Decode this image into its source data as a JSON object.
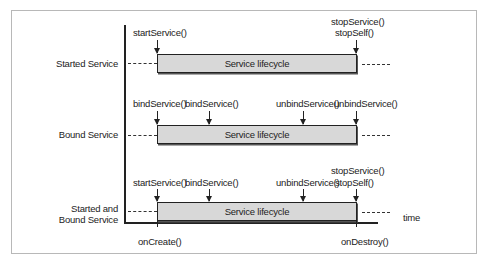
{
  "diagram": {
    "rows": [
      {
        "label": "Started Service",
        "box_label": "Service lifecycle",
        "events_start": [
          "startService()"
        ],
        "events_end_line1": "stopService()",
        "events_end_line2": "stopSelf()"
      },
      {
        "label": "Bound Service",
        "box_label": "Service lifecycle",
        "events_start": [
          "bindService()",
          "bindService()"
        ],
        "events_mid": "unbindService()",
        "events_end": "unbindService()"
      },
      {
        "label_line1": "Started and",
        "label_line2": "Bound Service",
        "box_label": "Service lifecycle",
        "events_start": [
          "startService()",
          "bindService()"
        ],
        "events_mid": "unbindService()",
        "events_end_line1": "stopService()",
        "events_end_line2": "stopSelf()"
      }
    ],
    "axis": {
      "x_label": "time",
      "start_tick": "onCreate()",
      "end_tick": "onDestroy()"
    }
  }
}
